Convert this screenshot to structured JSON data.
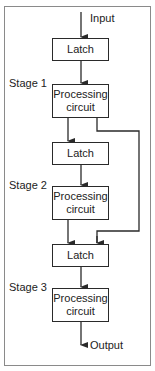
{
  "diagram": {
    "input_label": "Input",
    "output_label": "Output",
    "stages": [
      {
        "label": "Stage 1",
        "latch": "Latch",
        "circuit": "Processing circuit",
        "circuit_lines": [
          "Processing",
          "circuit"
        ]
      },
      {
        "label": "Stage 2",
        "latch": "Latch",
        "circuit": "Processing circuit",
        "circuit_lines": [
          "Processing",
          "circuit"
        ]
      },
      {
        "label": "Stage 3",
        "latch": "Latch",
        "circuit": "Processing circuit",
        "circuit_lines": [
          "Processing",
          "circuit"
        ]
      }
    ],
    "bypass": "Stage 1 output also routed directly to Stage 3 latch",
    "colors": {
      "line": "#2a2a2a",
      "frame": "#8a8a8a",
      "background": "#ffffff"
    }
  }
}
